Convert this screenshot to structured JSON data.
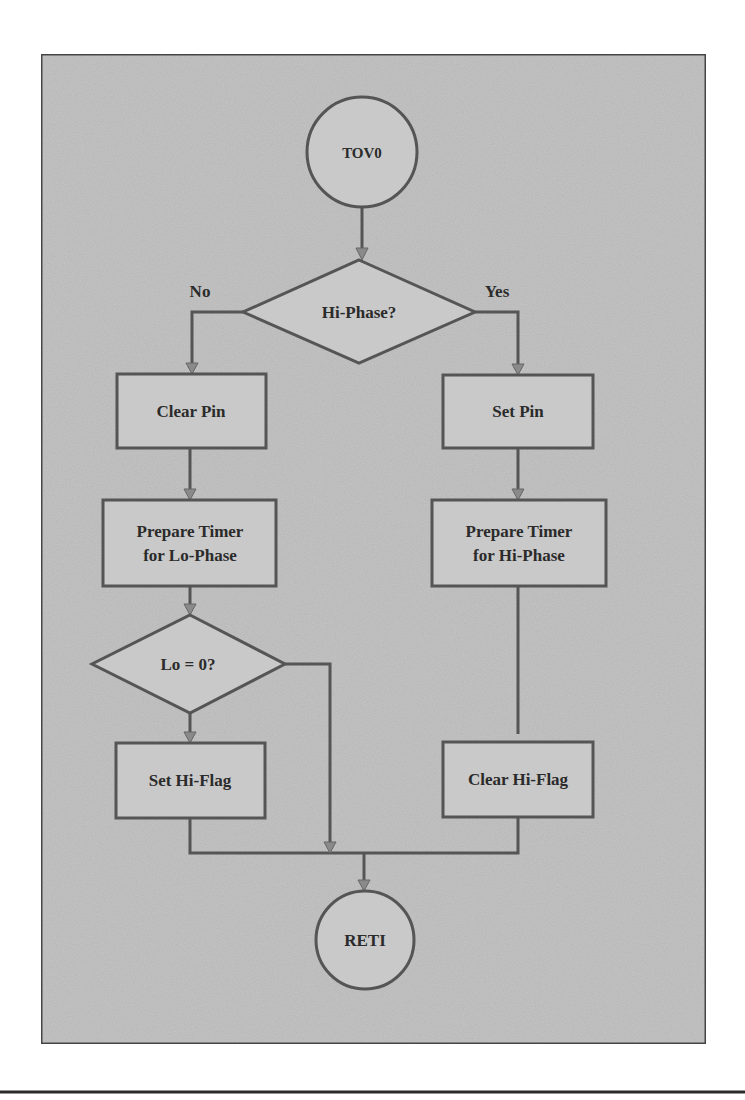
{
  "diagram": {
    "type": "flowchart",
    "colors": {
      "frame_fill": "#c6c6c6",
      "frame_stroke": "#4a4a4a",
      "node_fill": "#c9c9c9",
      "line": "#555555",
      "text": "#2b2b2b"
    },
    "nodes": {
      "start": {
        "shape": "circle",
        "label": "TOV0"
      },
      "hi_phase": {
        "shape": "diamond",
        "label": "Hi-Phase?"
      },
      "clear_pin": {
        "shape": "rect",
        "label": "Clear Pin"
      },
      "set_pin": {
        "shape": "rect",
        "label": "Set Pin"
      },
      "prep_lo": {
        "shape": "rect",
        "line1": "Prepare Timer",
        "line2": "for Lo-Phase"
      },
      "prep_hi": {
        "shape": "rect",
        "line1": "Prepare Timer",
        "line2": "for Hi-Phase"
      },
      "lo_zero": {
        "shape": "diamond",
        "label": "Lo = 0?"
      },
      "set_hi_flag": {
        "shape": "rect",
        "label": "Set Hi-Flag"
      },
      "clear_hi_flag": {
        "shape": "rect",
        "label": "Clear Hi-Flag"
      },
      "end": {
        "shape": "circle",
        "label": "RETI"
      }
    },
    "edge_labels": {
      "no": "No",
      "yes": "Yes"
    },
    "edges": [
      {
        "from": "TOV0",
        "to": "Hi-Phase?"
      },
      {
        "from": "Hi-Phase?",
        "to": "Clear Pin",
        "label": "No"
      },
      {
        "from": "Hi-Phase?",
        "to": "Set Pin",
        "label": "Yes"
      },
      {
        "from": "Clear Pin",
        "to": "Prepare Timer for Lo-Phase"
      },
      {
        "from": "Set Pin",
        "to": "Prepare Timer for Hi-Phase"
      },
      {
        "from": "Prepare Timer for Lo-Phase",
        "to": "Lo = 0?"
      },
      {
        "from": "Lo = 0?",
        "to": "Set Hi-Flag"
      },
      {
        "from": "Lo = 0?",
        "to": "RETI"
      },
      {
        "from": "Prepare Timer for Hi-Phase",
        "to": "Clear Hi-Flag"
      },
      {
        "from": "Set Hi-Flag",
        "to": "RETI"
      },
      {
        "from": "Clear Hi-Flag",
        "to": "RETI"
      }
    ]
  }
}
